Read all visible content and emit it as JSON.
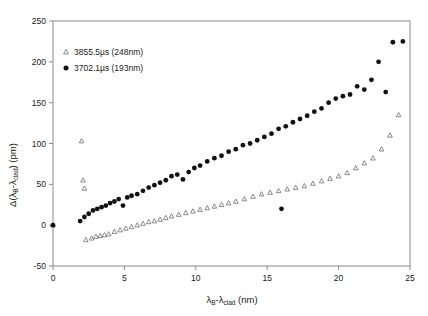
{
  "chart_data": {
    "type": "scatter",
    "title": "",
    "xlabel": "λB-λclad (nm)",
    "ylabel": "Δ(λB-λclad) (pm)",
    "xlim": [
      0,
      25
    ],
    "ylim": [
      -50,
      250
    ],
    "xticks": [
      0,
      5,
      10,
      15,
      20,
      25
    ],
    "yticks": [
      -50,
      0,
      50,
      100,
      150,
      200,
      250
    ],
    "grid": false,
    "legend_position": "top-left",
    "series": [
      {
        "name": "3855.5µs (248nm)",
        "marker": "open-triangle",
        "color": "#7d7d7d",
        "points": [
          [
            0.0,
            0.0
          ],
          [
            2.0,
            103.0
          ],
          [
            2.1,
            55.0
          ],
          [
            2.2,
            45.0
          ],
          [
            2.3,
            -18.0
          ],
          [
            2.7,
            -16.0
          ],
          [
            3.0,
            -14.0
          ],
          [
            3.3,
            -13.0
          ],
          [
            3.6,
            -12.0
          ],
          [
            3.9,
            -11.0
          ],
          [
            4.3,
            -8.0
          ],
          [
            4.7,
            -6.0
          ],
          [
            5.1,
            -4.0
          ],
          [
            5.5,
            -2.0
          ],
          [
            5.9,
            0.0
          ],
          [
            6.3,
            2.0
          ],
          [
            6.7,
            4.0
          ],
          [
            7.1,
            5.0
          ],
          [
            7.5,
            7.0
          ],
          [
            7.9,
            9.0
          ],
          [
            8.3,
            11.0
          ],
          [
            8.8,
            13.0
          ],
          [
            9.3,
            15.0
          ],
          [
            9.8,
            17.0
          ],
          [
            10.3,
            19.0
          ],
          [
            10.8,
            21.0
          ],
          [
            11.3,
            23.0
          ],
          [
            11.8,
            25.0
          ],
          [
            12.3,
            27.0
          ],
          [
            12.8,
            29.0
          ],
          [
            13.4,
            32.0
          ],
          [
            14.0,
            35.0
          ],
          [
            14.6,
            38.0
          ],
          [
            15.2,
            40.0
          ],
          [
            15.8,
            42.0
          ],
          [
            16.4,
            44.0
          ],
          [
            17.0,
            46.0
          ],
          [
            17.6,
            48.0
          ],
          [
            18.2,
            51.0
          ],
          [
            18.8,
            54.0
          ],
          [
            19.4,
            57.0
          ],
          [
            20.0,
            60.0
          ],
          [
            20.6,
            64.0
          ],
          [
            21.2,
            70.0
          ],
          [
            21.8,
            76.0
          ],
          [
            22.4,
            82.0
          ],
          [
            23.0,
            93.0
          ],
          [
            23.6,
            110.0
          ],
          [
            24.2,
            135.0
          ]
        ]
      },
      {
        "name": "3702.1µs (193nm)",
        "marker": "filled-circle",
        "color": "#111111",
        "points": [
          [
            0.0,
            0.0
          ],
          [
            1.9,
            5.0
          ],
          [
            2.2,
            10.0
          ],
          [
            2.5,
            14.0
          ],
          [
            2.8,
            18.0
          ],
          [
            3.1,
            20.0
          ],
          [
            3.4,
            22.0
          ],
          [
            3.7,
            24.0
          ],
          [
            4.0,
            27.0
          ],
          [
            4.3,
            29.0
          ],
          [
            4.6,
            32.0
          ],
          [
            4.9,
            24.0
          ],
          [
            5.2,
            34.0
          ],
          [
            5.5,
            36.0
          ],
          [
            5.9,
            38.0
          ],
          [
            6.3,
            42.0
          ],
          [
            6.7,
            46.0
          ],
          [
            7.1,
            49.0
          ],
          [
            7.5,
            52.0
          ],
          [
            7.9,
            55.0
          ],
          [
            8.3,
            60.0
          ],
          [
            8.7,
            62.0
          ],
          [
            9.1,
            56.0
          ],
          [
            9.5,
            65.0
          ],
          [
            9.9,
            70.0
          ],
          [
            10.3,
            73.0
          ],
          [
            10.8,
            78.0
          ],
          [
            11.3,
            82.0
          ],
          [
            11.8,
            85.0
          ],
          [
            12.3,
            90.0
          ],
          [
            12.8,
            93.0
          ],
          [
            13.3,
            98.0
          ],
          [
            13.8,
            100.0
          ],
          [
            14.3,
            104.0
          ],
          [
            14.8,
            108.0
          ],
          [
            15.3,
            112.0
          ],
          [
            15.8,
            118.0
          ],
          [
            16.0,
            20.0
          ],
          [
            16.3,
            121.0
          ],
          [
            16.8,
            126.0
          ],
          [
            17.3,
            130.0
          ],
          [
            17.8,
            134.0
          ],
          [
            18.3,
            139.0
          ],
          [
            18.8,
            143.0
          ],
          [
            19.3,
            150.0
          ],
          [
            19.8,
            155.0
          ],
          [
            20.3,
            158.0
          ],
          [
            20.8,
            160.0
          ],
          [
            21.3,
            170.0
          ],
          [
            21.8,
            166.0
          ],
          [
            22.3,
            178.0
          ],
          [
            22.8,
            200.0
          ],
          [
            23.3,
            163.0
          ],
          [
            23.8,
            224.0
          ],
          [
            24.5,
            225.0
          ]
        ]
      }
    ]
  },
  "legend": {
    "items": [
      {
        "marker": "open-triangle",
        "prefix": "3855.5µs",
        "suffix": "(248nm)"
      },
      {
        "marker": "filled-circle",
        "prefix": "3702.1µs",
        "suffix": "(193nm)"
      }
    ]
  },
  "axis": {
    "y_title_delta": "Δ(λ",
    "y_title_sub1": "B",
    "y_title_mid": "-λ",
    "y_title_sub2": "clad",
    "y_title_tail": ") (pm)",
    "x_title_lead": "λ",
    "x_title_sub1": "B",
    "x_title_mid": "-λ",
    "x_title_sub2": "clad",
    "x_title_tail": " (nm)"
  }
}
